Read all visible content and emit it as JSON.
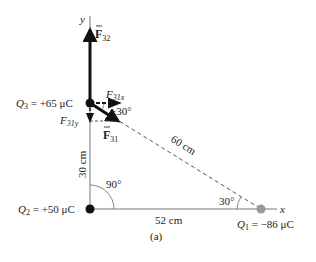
{
  "charges": {
    "q3": {
      "name": "Q",
      "sub": "3",
      "value": " = +65 μC"
    },
    "q2": {
      "name": "Q",
      "sub": "2",
      "value": " = +50 μC"
    },
    "q1": {
      "name": "Q",
      "sub": "1",
      "value": " = −86 μC"
    }
  },
  "axes": {
    "x": "x",
    "y": "y"
  },
  "forces": {
    "f32": {
      "main": "F",
      "sub": "32"
    },
    "f31": {
      "main": "F",
      "sub": "31"
    },
    "f31x": {
      "main": "F",
      "sub": "31x"
    },
    "f31y": {
      "main": "F",
      "sub": "31y"
    }
  },
  "distances": {
    "vertical": "30 cm",
    "horizontal": "52 cm",
    "diagonal": "60 cm"
  },
  "angles": {
    "right": "90°",
    "q1": "30°",
    "f31": "+30°"
  },
  "caption": "(a)",
  "colors": {
    "ink": "#111111",
    "axis": "#777777",
    "q1": "#999999"
  }
}
